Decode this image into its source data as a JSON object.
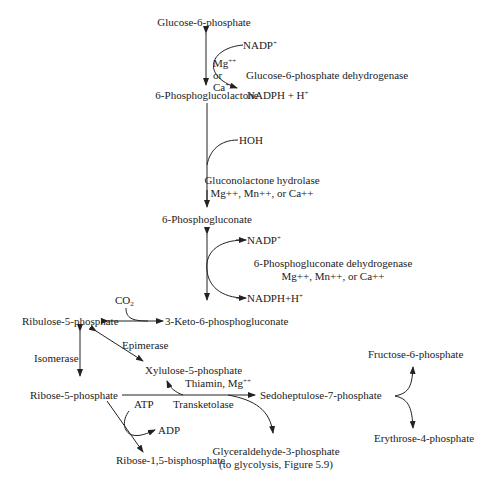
{
  "metabolites": {
    "g6p": "Glucose-6-phosphate",
    "pgl": "6-Phosphoglucolactone",
    "pg": "6-Phosphogluconate",
    "keto": "3-Keto-6-phosphogluconate",
    "ru5p": "Ribulose-5-phosphate",
    "xu5p": "Xylulose-5-phosphate",
    "r5p": "Ribose-5-phosphate",
    "s7p": "Sedoheptulose-7-phosphate",
    "f6p": "Fructose-6-phosphate",
    "e4p": "Erythrose-4-phosphate",
    "rbp": "Ribose-1,5-bisphosphate",
    "gap": "Glyceraldehyde-3-phosphate",
    "gap_note": "(to glycolysis, Figure 5.9)"
  },
  "cofactors": {
    "nadp1": "NADP",
    "nadp1_sup": "+",
    "nadph1": "NADPH + H",
    "nadph1_sup": "+",
    "mg": "Mg",
    "mg_sup": "++",
    "or": "or",
    "ca": "Ca",
    "ca_sup": "++",
    "hoh": "HOH",
    "nadp2": "NADP",
    "nadp2_sup": "+",
    "nadph2": "NADPH+H",
    "nadph2_sup": "+",
    "co2": "CO",
    "co2_sub": "2",
    "atp": "ATP",
    "adp": "ADP",
    "thiamin": "Thiamin, Mg",
    "thiamin_sup": "++"
  },
  "enzymes": {
    "g6pd": "Glucose-6-phosphate dehydrogenase",
    "glh": "Gluconolactone hydrolase",
    "glh_ions": "Mg++, Mn++, or Ca++",
    "pgd": "6-Phosphogluconate dehydrogenase",
    "pgd_ions": "Mg++, Mn++, or Ca++",
    "epimerase": "Epimerase",
    "isomerase": "Isomerase",
    "transketolase": "Transketolase"
  },
  "colors": {
    "ink": "#222222",
    "background": "#ffffff"
  }
}
